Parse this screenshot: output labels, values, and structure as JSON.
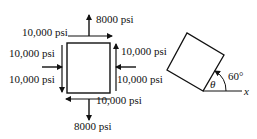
{
  "diagram": {
    "stress_element": {
      "normal_x_left": "10,000 psi",
      "normal_x_right": "10,000 psi",
      "shear_top": "10,000 psi",
      "shear_left": "10,000 psi",
      "shear_right": "10,000 psi",
      "shear_bottom": "10,000 psi",
      "normal_y_top": "8000 psi",
      "normal_y_bottom": "8000 psi"
    },
    "rotated_element": {
      "angle_label": "60°",
      "theta_label": "θ",
      "axis_label": "x"
    },
    "colors": {
      "stroke": "#111111",
      "background": "#ffffff"
    }
  }
}
